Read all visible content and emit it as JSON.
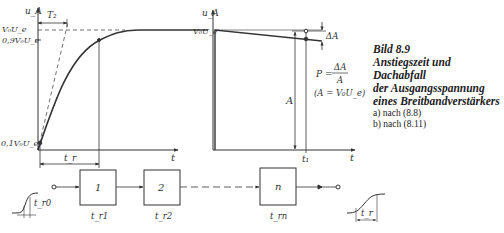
{
  "caption": {
    "figure": "Bild 8.9",
    "title_lines": [
      "Anstiegszeit und Dachabfall",
      "der Ausgangsspannung",
      "eines Breitbandverstärkers"
    ],
    "subitems": [
      "a) nach (8.8)",
      "b) nach (8.11)"
    ]
  },
  "plot_a": {
    "y_axis_label": "u_A",
    "x_axis_label": "t",
    "level_full": "V₀U_e",
    "level_90": "0,9V₀U_e",
    "level_10": "0,1V₀U_e",
    "time_constant": "T₂",
    "rise_time": "t_r"
  },
  "plot_b": {
    "y_axis_label": "u_A",
    "x_axis_label": "t",
    "level_full": "V₀U_e",
    "delta": "ΔA",
    "amplitude": "A",
    "time_mark": "t₁",
    "formula_lhs": "P =",
    "formula_num": "ΔA",
    "formula_den": "A",
    "formula_note": "(A = V₀U_e)"
  },
  "chain": {
    "input_rise": "t_r0",
    "output_rise": "t_r",
    "blocks": [
      {
        "label": "1",
        "rise": "t_r1"
      },
      {
        "label": "2",
        "rise": "t_r2"
      },
      {
        "label": "n",
        "rise": "t_rn"
      }
    ]
  }
}
